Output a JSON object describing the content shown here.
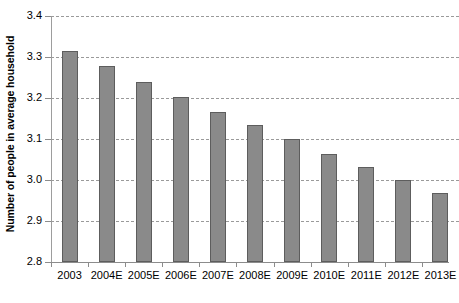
{
  "chart_data": {
    "type": "bar",
    "title": "",
    "xlabel": "",
    "ylabel": "Number of people in average household",
    "ylim": [
      2.8,
      3.4
    ],
    "ytick_labels": [
      "3.4",
      "3.3",
      "3.2",
      "3.1",
      "3.0",
      "2.9",
      "2.8"
    ],
    "ytick_values": [
      3.4,
      3.3,
      3.2,
      3.1,
      3.0,
      2.9,
      2.8
    ],
    "grid": true,
    "legend": false,
    "categories": [
      "2003",
      "2004E",
      "2005E",
      "2006E",
      "2007E",
      "2008E",
      "2009E",
      "2010E",
      "2011E",
      "2012E",
      "2013E"
    ],
    "values": [
      3.315,
      3.277,
      3.238,
      3.203,
      3.167,
      3.133,
      3.1,
      3.063,
      3.032,
      3.0,
      2.968
    ],
    "bar_color": "#8a8a8a",
    "bar_edge_color": "#5d5d5d",
    "gridline_color": "#9a9a9a",
    "axis_color": "#8c8c8c"
  },
  "caption": {
    "text": ""
  }
}
